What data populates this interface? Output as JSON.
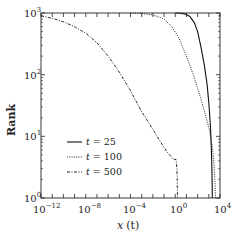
{
  "chart_data": {
    "type": "line",
    "title": "",
    "xlabel": "x (t)",
    "ylabel": "Rank",
    "xscale": "log",
    "yscale": "log",
    "xlim": [
      1e-12,
      10000.0
    ],
    "ylim": [
      1,
      1000
    ],
    "x_ticks": [
      "10^-12",
      "10^-8",
      "10^-4",
      "10^0",
      "10^4"
    ],
    "y_ticks": [
      "10^0",
      "10^1",
      "10^2",
      "10^3"
    ],
    "grid": false,
    "legend_position": "lower left",
    "series": [
      {
        "name": "t = 25",
        "style": "solid",
        "points": [
          [
            1,
            1000
          ],
          [
            3,
            990
          ],
          [
            8,
            960
          ],
          [
            20,
            880
          ],
          [
            50,
            700
          ],
          [
            100,
            500
          ],
          [
            200,
            280
          ],
          [
            400,
            140
          ],
          [
            700,
            70
          ],
          [
            1000,
            35
          ],
          [
            1400,
            15
          ],
          [
            1700,
            6
          ],
          [
            1900,
            3
          ],
          [
            2000,
            1.5
          ],
          [
            2050,
            1
          ]
        ]
      },
      {
        "name": "t = 100",
        "style": "dotted",
        "points": [
          [
            0.0001,
            1000
          ],
          [
            0.001,
            980
          ],
          [
            0.01,
            930
          ],
          [
            0.1,
            800
          ],
          [
            0.5,
            600
          ],
          [
            2,
            400
          ],
          [
            10,
            200
          ],
          [
            50,
            90
          ],
          [
            200,
            40
          ],
          [
            600,
            20
          ],
          [
            1200,
            12
          ],
          [
            2000,
            7
          ],
          [
            2800,
            4
          ],
          [
            3500,
            2
          ],
          [
            4000,
            1
          ]
        ]
      },
      {
        "name": "t = 500",
        "style": "dashdot",
        "points": [
          [
            1e-12,
            900
          ],
          [
            1e-11,
            820
          ],
          [
            1e-10,
            720
          ],
          [
            1e-09,
            600
          ],
          [
            1e-08,
            470
          ],
          [
            1e-07,
            330
          ],
          [
            1e-06,
            200
          ],
          [
            1e-05,
            110
          ],
          [
            0.0001,
            55
          ],
          [
            0.001,
            25
          ],
          [
            0.01,
            13
          ],
          [
            0.05,
            8
          ],
          [
            0.2,
            5.5
          ],
          [
            0.6,
            4.3
          ],
          [
            1.2,
            4.2
          ],
          [
            1.4,
            3
          ],
          [
            1.5,
            2
          ],
          [
            1.6,
            1
          ]
        ]
      }
    ]
  },
  "axes": {
    "xlabel_main": "x",
    "xlabel_paren": "(t)",
    "ylabel": "Rank",
    "x_ticks": [
      {
        "base": "10",
        "exp": "−12"
      },
      {
        "base": "10",
        "exp": "−8"
      },
      {
        "base": "10",
        "exp": "−4"
      },
      {
        "base": "10",
        "exp": "0"
      },
      {
        "base": "10",
        "exp": "4"
      }
    ],
    "y_ticks": [
      {
        "base": "10",
        "exp": "0"
      },
      {
        "base": "10",
        "exp": "1"
      },
      {
        "base": "10",
        "exp": "2"
      },
      {
        "base": "10",
        "exp": "3"
      }
    ]
  },
  "legend": [
    {
      "t": "t",
      "eq": " = 25"
    },
    {
      "t": "t",
      "eq": " = 100"
    },
    {
      "t": "t",
      "eq": " = 500"
    }
  ]
}
